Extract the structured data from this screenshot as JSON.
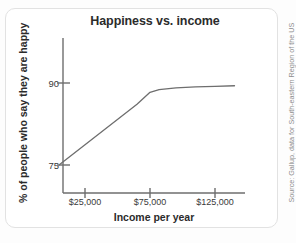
{
  "chart_data": {
    "type": "line",
    "title": "Happiness vs. income",
    "xlabel": "Income per year",
    "ylabel": "% of people who say they are happy",
    "xlim": [
      5000,
      145000
    ],
    "ylim": [
      68,
      96
    ],
    "grid": false,
    "legend": null,
    "xticks": [
      {
        "value": 25000,
        "label": "$25,000"
      },
      {
        "value": 75000,
        "label": "$75,000"
      },
      {
        "value": 125000,
        "label": "$125,000"
      }
    ],
    "yticks": [
      {
        "value": 90,
        "label": "90"
      },
      {
        "value": 75,
        "label": "75"
      }
    ],
    "series": [
      {
        "name": "Happiness",
        "color": "#6e6e6e",
        "x": [
          5000,
          25000,
          45000,
          65000,
          75000,
          82000,
          95000,
          110000,
          125000,
          140000
        ],
        "y": [
          75.0,
          78.7,
          82.4,
          86.1,
          88.3,
          88.8,
          89.1,
          89.3,
          89.4,
          89.5
        ]
      }
    ],
    "annotations": [],
    "source": "Source: Gallup, data for South-eastern Region of the US"
  }
}
